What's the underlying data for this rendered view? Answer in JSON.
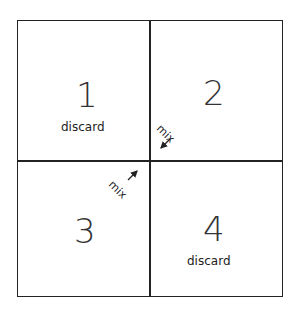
{
  "quadrants": [
    {
      "number": "1",
      "label": "discard"
    },
    {
      "number": "2",
      "label": ""
    },
    {
      "number": "3",
      "label": ""
    },
    {
      "number": "4",
      "label": "discard"
    }
  ],
  "arrows": [
    {
      "label": "mix",
      "from": "2",
      "direction": "toward-center"
    },
    {
      "label": "mix",
      "from": "3",
      "direction": "toward-center"
    }
  ]
}
